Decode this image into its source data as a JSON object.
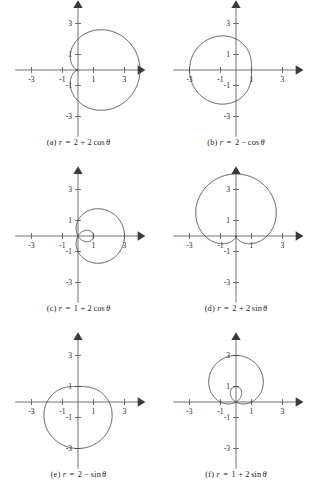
{
  "figure": {
    "background_color": "#ffffff",
    "curve_color": "#3c3c3e",
    "axis_color": "#58595b",
    "label_color": "#231f20",
    "columns": 2,
    "rows": 3
  },
  "axes": {
    "tick_values_x": [
      "-3",
      "-1",
      "1",
      "3"
    ],
    "tick_values_y": [
      "3",
      "1",
      "-1",
      "-3"
    ],
    "x_range": [
      -4.1,
      4.1
    ],
    "y_range": [
      -4.1,
      4.1
    ],
    "units_per_tick": 2,
    "grid": false,
    "arrowheads": [
      "x-positive",
      "y-positive"
    ]
  },
  "chart_data": [
    {
      "id": "a",
      "type": "line",
      "plot_kind": "polar",
      "caption": "(a) r = 2 + 2 cos θ",
      "caption_parts": {
        "index": "(a)",
        "variable": "r",
        "equals": "=",
        "terms": "2 + 2",
        "fn": "cos",
        "theta": "θ"
      },
      "equation": "r = 2 + 2cos(theta)",
      "curve_name": "cardioid",
      "a": 2,
      "b": 2,
      "trig": "cos",
      "extent": {
        "x_min": 0,
        "x_max": 4,
        "y_min": -2.6,
        "y_max": 2.6
      },
      "cusp": [
        0,
        0
      ],
      "max_radius": 4,
      "title": "",
      "xlabel": "",
      "ylabel": ""
    },
    {
      "id": "b",
      "type": "line",
      "plot_kind": "polar",
      "caption": "(b) r = 2 − cos θ",
      "caption_parts": {
        "index": "(b)",
        "variable": "r",
        "equals": "=",
        "terms": "2 −",
        "fn": "cos",
        "theta": "θ"
      },
      "equation": "r = 2 - cos(theta)",
      "curve_name": "convex limacon",
      "a": 2,
      "b": -1,
      "trig": "cos",
      "extent": {
        "x_min": -3,
        "x_max": 1,
        "y_min": -2.06,
        "y_max": 2.06
      },
      "max_radius": 3,
      "title": "",
      "xlabel": "",
      "ylabel": ""
    },
    {
      "id": "c",
      "type": "line",
      "plot_kind": "polar",
      "caption": "(c) r = 1 + 2 cos θ",
      "caption_parts": {
        "index": "(c)",
        "variable": "r",
        "equals": "=",
        "terms": "1 + 2",
        "fn": "cos",
        "theta": "θ"
      },
      "equation": "r = 1 + 2cos(theta)",
      "curve_name": "limacon with inner loop",
      "a": 1,
      "b": 2,
      "trig": "cos",
      "extent": {
        "x_min": -1,
        "x_max": 3,
        "y_min": -1.3,
        "y_max": 1.3
      },
      "inner_loop": true,
      "inner_loop_extent_x": [
        0,
        1
      ],
      "max_radius": 3,
      "title": "",
      "xlabel": "",
      "ylabel": ""
    },
    {
      "id": "d",
      "type": "line",
      "plot_kind": "polar",
      "caption": "(d) r = 2 + 2 sin θ",
      "caption_parts": {
        "index": "(d)",
        "variable": "r",
        "equals": "=",
        "terms": "2 + 2",
        "fn": "sin",
        "theta": "θ"
      },
      "equation": "r = 2 + 2sin(theta)",
      "curve_name": "cardioid",
      "a": 2,
      "b": 2,
      "trig": "sin",
      "extent": {
        "x_min": -2.6,
        "x_max": 2.6,
        "y_min": 0,
        "y_max": 4
      },
      "cusp": [
        0,
        0
      ],
      "max_radius": 4,
      "title": "",
      "xlabel": "",
      "ylabel": ""
    },
    {
      "id": "e",
      "type": "line",
      "plot_kind": "polar",
      "caption": "(e) r = 2 − sin θ",
      "caption_parts": {
        "index": "(e)",
        "variable": "r",
        "equals": "=",
        "terms": "2 −",
        "fn": "sin",
        "theta": "θ"
      },
      "equation": "r = 2 - sin(theta)",
      "curve_name": "convex limacon",
      "a": 2,
      "b": -1,
      "trig": "sin",
      "extent": {
        "x_min": -2.06,
        "x_max": 2.06,
        "y_min": -3,
        "y_max": 1
      },
      "max_radius": 3,
      "title": "",
      "xlabel": "",
      "ylabel": ""
    },
    {
      "id": "f",
      "type": "line",
      "plot_kind": "polar",
      "caption": "(f) r = 1 + 2 sin θ",
      "caption_parts": {
        "index": "(f)",
        "variable": "r",
        "equals": "=",
        "terms": "1 + 2",
        "fn": "sin",
        "theta": "θ"
      },
      "equation": "r = 1 + 2sin(theta)",
      "curve_name": "limacon with inner loop",
      "a": 1,
      "b": 2,
      "trig": "sin",
      "extent": {
        "x_min": -1.3,
        "x_max": 1.3,
        "y_min": -1,
        "y_max": 3
      },
      "inner_loop": true,
      "inner_loop_extent_y": [
        0,
        1
      ],
      "max_radius": 3,
      "title": "",
      "xlabel": "",
      "ylabel": ""
    }
  ]
}
